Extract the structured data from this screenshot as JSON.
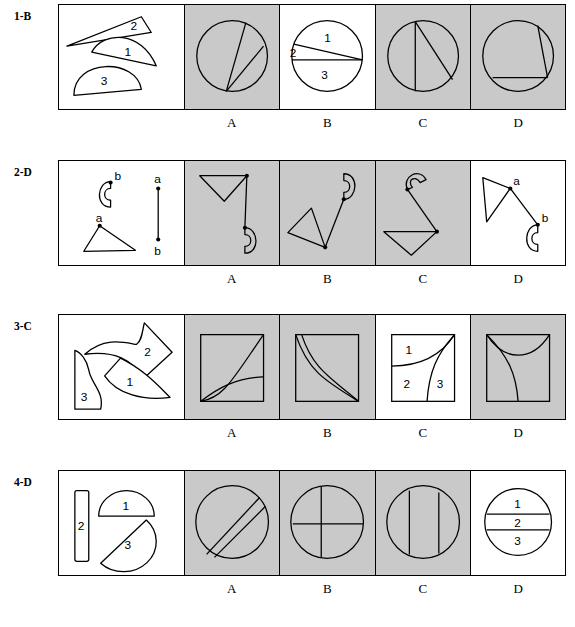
{
  "page": {
    "background_color": "#ffffff",
    "option_shaded_color": "#c9c9c9",
    "option_unshaded_color": "#ffffff",
    "stroke_color": "#000000"
  },
  "option_letters": [
    "A",
    "B",
    "C",
    "D"
  ],
  "questions": [
    {
      "id": "q1",
      "label": "1-B",
      "answer": "B",
      "stem": {
        "piece_labels": [
          "1",
          "2",
          "3"
        ],
        "description": "three circle-sector pieces: thin sliver 2, lens 1, half-disc 3"
      },
      "options": [
        {
          "letter": "A",
          "shaded": true,
          "description": "circle with two chords meeting at bottom point"
        },
        {
          "letter": "B",
          "shaded": false,
          "description": "circle divided by a horizontal diameter and one chord, regions labelled 1, 2, 3",
          "piece_labels": [
            "1",
            "2",
            "3"
          ]
        },
        {
          "letter": "C",
          "shaded": true,
          "description": "circle with vertical chord and diagonal chord"
        },
        {
          "letter": "D",
          "shaded": true,
          "description": "circle with slanted chord and horizontal chord"
        }
      ]
    },
    {
      "id": "q2",
      "label": "2-D",
      "answer": "D",
      "stem": {
        "point_labels": [
          "a",
          "b"
        ],
        "connector_labels": [
          "a",
          "b"
        ],
        "description": "hook shape marked b, triangle marked a, plus vertical a-to-b connector segment"
      },
      "options": [
        {
          "letter": "A",
          "shaded": true,
          "description": "triangle joined by a vertical line down to a hook"
        },
        {
          "letter": "B",
          "shaded": true,
          "description": "triangle joined by a slanted line up-right to a hook"
        },
        {
          "letter": "C",
          "shaded": true,
          "description": "triangle joined by a slanted line up-left to a hook"
        },
        {
          "letter": "D",
          "shaded": false,
          "description": "triangle at a joined by a long slant down-right to hook at b",
          "point_labels": [
            "a",
            "b"
          ]
        }
      ]
    },
    {
      "id": "q3",
      "label": "3-C",
      "answer": "C",
      "stem": {
        "piece_labels": [
          "1",
          "2",
          "3"
        ],
        "description": "three curved puzzle pieces 1, 2, 3"
      },
      "options": [
        {
          "letter": "A",
          "shaded": true,
          "description": "square with two curves rising from bottom-left corner"
        },
        {
          "letter": "B",
          "shaded": true,
          "description": "square with two near-parallel S-curves from top-left to bottom-right"
        },
        {
          "letter": "C",
          "shaded": false,
          "description": "square split into regions 1, 2, 3 by a horizontal line and an S-curve",
          "piece_labels": [
            "1",
            "2",
            "3"
          ]
        },
        {
          "letter": "D",
          "shaded": true,
          "description": "square with a sagging top curve and an S-curve down to the bottom"
        }
      ]
    },
    {
      "id": "q4",
      "label": "4-D",
      "answer": "D",
      "stem": {
        "piece_labels": [
          "1",
          "2",
          "3"
        ],
        "description": "narrow vertical bar 2, upper half-disc 1, lower half-disc 3"
      },
      "options": [
        {
          "letter": "A",
          "shaded": true,
          "description": "circle crossed by two parallel diagonal lines"
        },
        {
          "letter": "B",
          "shaded": true,
          "description": "circle crossed by a vertical line and a horizontal line"
        },
        {
          "letter": "C",
          "shaded": true,
          "description": "circle crossed by two parallel vertical lines"
        },
        {
          "letter": "D",
          "shaded": false,
          "description": "circle cut by two horizontal lines into bands 1, 2, 3",
          "piece_labels": [
            "1",
            "2",
            "3"
          ]
        }
      ]
    }
  ]
}
